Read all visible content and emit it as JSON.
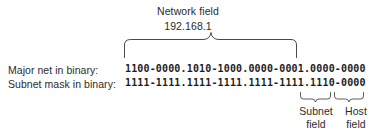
{
  "diagram": {
    "background_color": "#ffffff",
    "text_color": "#2b2b2b",
    "stroke_color": "#4a4a4a",
    "network_field": {
      "label": "Network field",
      "value": "192.168.1"
    },
    "rows": [
      {
        "label": "Major net in binary:",
        "binary": "1100-0000.1010-1000.0000-0001.0000-0000"
      },
      {
        "label": "Subnet mask in binary:",
        "binary": "1111-1111.1111-1111.1111-1111.1110-0000"
      }
    ],
    "subnet_field": {
      "line1": "Subnet",
      "line2": "field"
    },
    "host_field": {
      "line1": "Host",
      "line2": "field"
    },
    "braces": {
      "network_brace_name": "network-field-brace",
      "subnet_brace_name": "subnet-field-brace",
      "host_brace_name": "host-field-brace"
    }
  }
}
